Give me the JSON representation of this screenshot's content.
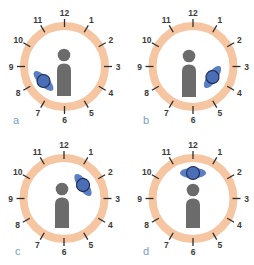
{
  "figure": {
    "colors": {
      "ring_fill": "#f6c6a2",
      "ring_stroke": "#eab48c",
      "tick": "#2e2e2e",
      "hour_text": "#3a3a3a",
      "person": "#6b6b6b",
      "source_fill": "#4a6fb6",
      "source_lobes": "#5b7fc2",
      "source_outline": "#1e2a55",
      "panel_label": "#7a9cc6"
    },
    "clock_hours": [
      "12",
      "1",
      "2",
      "3",
      "4",
      "5",
      "6",
      "7",
      "8",
      "9",
      "10",
      "11"
    ],
    "panels": [
      {
        "label": "a",
        "source_position": "8 o'clock (lower-left, near person)",
        "source_orientation": "diagonal-down-right"
      },
      {
        "label": "b",
        "source_position": "4 o'clock (lower-right, near person)",
        "source_orientation": "diagonal-up-right"
      },
      {
        "label": "c",
        "source_position": "2 o'clock (upper-right)",
        "source_orientation": "diagonal-down-right"
      },
      {
        "label": "d",
        "source_position": "12 o'clock (directly above person)",
        "source_orientation": "horizontal"
      }
    ]
  }
}
